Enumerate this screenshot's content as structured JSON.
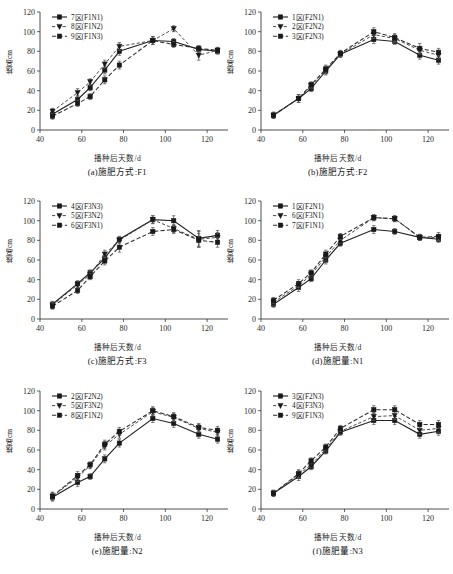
{
  "figure": {
    "axis": {
      "xlabel": "播种后天数/d",
      "ylabel": "株高/cm",
      "xticks": [
        40,
        60,
        80,
        100,
        120
      ],
      "yticks": [
        0,
        20,
        40,
        60,
        80,
        100,
        120
      ],
      "xlim": [
        40,
        130
      ],
      "ylim": [
        0,
        120
      ],
      "grid": false,
      "legend_position": "upper-left"
    },
    "panels": [
      {
        "key": "a",
        "caption": "(a)施肥方式:F1",
        "chart_data": {
          "type": "line",
          "title": "(a)施肥方式:F1",
          "xlabel": "播种后天数/d",
          "ylabel": "株高/cm",
          "xlim": [
            40,
            130
          ],
          "ylim": [
            0,
            120
          ],
          "x": [
            46,
            58,
            64,
            71,
            78,
            94,
            104,
            116,
            125
          ],
          "series": [
            {
              "name": "7区(F1N1)",
              "style": "solid-square",
              "values": [
                16,
                31,
                43,
                61,
                80,
                91,
                90,
                82,
                80
              ],
              "errors": [
                3,
                4,
                3,
                4,
                4,
                4,
                3,
                3,
                3
              ]
            },
            {
              "name": "8区(F1N2)",
              "style": "dashed-triangle",
              "values": [
                19,
                38,
                49,
                67,
                85,
                91,
                103,
                76,
                81
              ],
              "errors": [
                3,
                4,
                3,
                4,
                4,
                4,
                3,
                5,
                3
              ]
            },
            {
              "name": "9区(F1N3)",
              "style": "dashed-square",
              "values": [
                14,
                27,
                34,
                51,
                66,
                91,
                87,
                83,
                81
              ],
              "errors": [
                3,
                3,
                3,
                4,
                4,
                4,
                3,
                3,
                3
              ]
            }
          ]
        }
      },
      {
        "key": "b",
        "caption": "(b)施肥方式:F2",
        "chart_data": {
          "type": "line",
          "title": "(b)施肥方式:F2",
          "xlabel": "播种后天数/d",
          "ylabel": "株高/cm",
          "xlim": [
            40,
            130
          ],
          "ylim": [
            0,
            120
          ],
          "x": [
            46,
            58,
            64,
            71,
            78,
            94,
            104,
            116,
            125
          ],
          "series": [
            {
              "name": "1区(F2N1)",
              "style": "solid-square",
              "values": [
                15,
                32,
                42,
                60,
                77,
                92,
                90,
                76,
                71
              ],
              "errors": [
                3,
                4,
                3,
                4,
                3,
                4,
                3,
                4,
                4
              ]
            },
            {
              "name": "2区(F2N2)",
              "style": "dashed-triangle",
              "values": [
                15,
                32,
                45,
                61,
                77,
                97,
                93,
                81,
                76
              ],
              "errors": [
                3,
                4,
                3,
                4,
                3,
                4,
                4,
                4,
                4
              ]
            },
            {
              "name": "3区(F2N3)",
              "style": "dashed-square",
              "values": [
                15,
                32,
                46,
                62,
                78,
                100,
                94,
                83,
                79
              ],
              "errors": [
                3,
                4,
                3,
                4,
                3,
                4,
                4,
                5,
                4
              ]
            }
          ]
        }
      },
      {
        "key": "c",
        "caption": "(c)施肥方式:F3",
        "chart_data": {
          "type": "line",
          "title": "(c)施肥方式:F3",
          "xlabel": "播种后天数/d",
          "ylabel": "株高/cm",
          "xlim": [
            40,
            130
          ],
          "ylim": [
            0,
            120
          ],
          "x": [
            46,
            58,
            64,
            71,
            78,
            94,
            104,
            116,
            125
          ],
          "series": [
            {
              "name": "4区(F3N3)",
              "style": "solid-square",
              "values": [
                15,
                36,
                47,
                62,
                81,
                101,
                100,
                82,
                85
              ],
              "errors": [
                3,
                3,
                3,
                4,
                3,
                4,
                5,
                8,
                5
              ]
            },
            {
              "name": "5区(F3N2)",
              "style": "dashed-triangle",
              "values": [
                14,
                35,
                45,
                66,
                80,
                101,
                92,
                81,
                83
              ],
              "errors": [
                3,
                3,
                3,
                4,
                3,
                4,
                4,
                8,
                5
              ]
            },
            {
              "name": "6区(F3N1)",
              "style": "dashed-square",
              "values": [
                13,
                29,
                43,
                59,
                73,
                89,
                91,
                80,
                78
              ],
              "errors": [
                3,
                3,
                3,
                4,
                5,
                4,
                4,
                7,
                5
              ]
            }
          ]
        }
      },
      {
        "key": "d",
        "caption": "(d)施肥量:N1",
        "chart_data": {
          "type": "line",
          "title": "(d)施肥量:N1",
          "xlabel": "播种后天数/d",
          "ylabel": "株高/cm",
          "xlim": [
            40,
            130
          ],
          "ylim": [
            0,
            120
          ],
          "x": [
            46,
            58,
            64,
            71,
            78,
            94,
            104,
            116,
            125
          ],
          "series": [
            {
              "name": "1区(F2N1)",
              "style": "solid-square",
              "values": [
                15,
                32,
                41,
                60,
                77,
                91,
                89,
                83,
                81
              ],
              "errors": [
                3,
                4,
                3,
                4,
                3,
                4,
                3,
                3,
                3
              ]
            },
            {
              "name": "6区(F3N1)",
              "style": "dashed-triangle",
              "values": [
                17,
                34,
                45,
                63,
                80,
                103,
                102,
                83,
                83
              ],
              "errors": [
                3,
                4,
                3,
                4,
                3,
                3,
                3,
                3,
                3
              ]
            },
            {
              "name": "7区(F1N1)",
              "style": "dashed-square",
              "values": [
                19,
                36,
                47,
                66,
                84,
                103,
                102,
                83,
                84
              ],
              "errors": [
                3,
                4,
                3,
                4,
                3,
                3,
                3,
                3,
                4
              ]
            }
          ]
        }
      },
      {
        "key": "e",
        "caption": "(e)施肥量:N2",
        "chart_data": {
          "type": "line",
          "title": "(e)施肥量:N2",
          "xlabel": "播种后天数/d",
          "ylabel": "株高/cm",
          "xlim": [
            40,
            130
          ],
          "ylim": [
            0,
            120
          ],
          "x": [
            46,
            58,
            64,
            71,
            78,
            94,
            104,
            116,
            125
          ],
          "series": [
            {
              "name": "2区(F2N2)",
              "style": "solid-square",
              "values": [
                12,
                27,
                33,
                51,
                67,
                92,
                87,
                76,
                71
              ],
              "errors": [
                4,
                4,
                3,
                4,
                4,
                4,
                4,
                4,
                4
              ]
            },
            {
              "name": "5区(F3N2)",
              "style": "dashed-triangle",
              "values": [
                13,
                32,
                44,
                64,
                76,
                99,
                93,
                82,
                78
              ],
              "errors": [
                4,
                4,
                3,
                4,
                4,
                4,
                4,
                4,
                4
              ]
            },
            {
              "name": "8区(F1N2)",
              "style": "dashed-square",
              "values": [
                13,
                34,
                45,
                66,
                79,
                100,
                94,
                83,
                80
              ],
              "errors": [
                4,
                4,
                3,
                4,
                4,
                4,
                4,
                4,
                4
              ]
            }
          ]
        }
      },
      {
        "key": "f",
        "caption": "(f)施肥量:N3",
        "chart_data": {
          "type": "line",
          "title": "(f)施肥量:N3",
          "xlabel": "播种后天数/d",
          "ylabel": "株高/cm",
          "xlim": [
            40,
            130
          ],
          "ylim": [
            0,
            120
          ],
          "x": [
            46,
            58,
            64,
            71,
            78,
            94,
            104,
            116,
            125
          ],
          "series": [
            {
              "name": "3区(F2N3)",
              "style": "solid-square",
              "values": [
                16,
                33,
                43,
                59,
                78,
                90,
                90,
                76,
                79
              ],
              "errors": [
                3,
                4,
                3,
                3,
                3,
                4,
                4,
                4,
                4
              ]
            },
            {
              "name": "4区(F3N3)",
              "style": "dashed-triangle",
              "values": [
                16,
                35,
                45,
                61,
                79,
                94,
                95,
                80,
                82
              ],
              "errors": [
                3,
                4,
                3,
                3,
                3,
                4,
                4,
                4,
                4
              ]
            },
            {
              "name": "9区(F1N3)",
              "style": "dashed-square",
              "values": [
                16,
                36,
                49,
                63,
                82,
                101,
                101,
                86,
                86
              ],
              "errors": [
                3,
                4,
                3,
                3,
                3,
                4,
                4,
                4,
                4
              ]
            }
          ]
        }
      }
    ]
  }
}
